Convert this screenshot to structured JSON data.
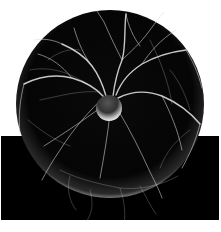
{
  "image": {
    "subject": "plasma ball",
    "style": "black and white photograph",
    "colors": {
      "background": "#ffffff",
      "base": "#000000",
      "sphere": "#050505",
      "filament": "#e8e8e8",
      "electrode": "#dcdcdc"
    }
  }
}
